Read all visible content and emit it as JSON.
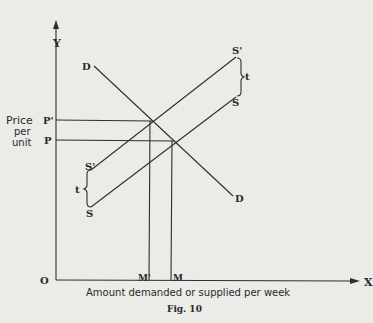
{
  "figure": {
    "caption": "Fig. 10",
    "axes": {
      "y_label": "Y",
      "x_label": "X",
      "origin_label": "O",
      "y_title_lines": [
        "Price",
        "per",
        "unit"
      ],
      "x_title": "Amount demanded or supplied per week"
    },
    "curves": {
      "demand_label_top": "D",
      "demand_label_bottom": "D",
      "supply_original_label_top": "S",
      "supply_original_label_bottom": "S",
      "supply_shifted_label_top": "S'",
      "supply_shifted_label_bottom": "S'",
      "tax_label_top": "t",
      "tax_label_bottom": "t"
    },
    "price_levels": {
      "new_price": "P'",
      "old_price": "P"
    },
    "quantity_levels": {
      "new_quantity": "M'",
      "old_quantity": "M"
    },
    "colors": {
      "ink": "#2e2e2e",
      "paper": "#ebebe8"
    }
  }
}
